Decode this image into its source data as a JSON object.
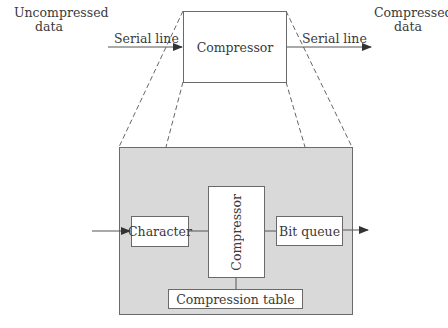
{
  "top": {
    "input_label": "Uncompressed data",
    "input_line1": "Uncompressed",
    "input_line2": "data",
    "input_link_label": "Serial line",
    "compressor_label": "Compressor",
    "output_link_label": "Serial line",
    "output_line1": "Compressed",
    "output_line2": "data"
  },
  "detail": {
    "character_label": "Character",
    "compressor_label": "Compressor",
    "bit_queue_label": "Bit queue",
    "compression_table_label": "Compression table"
  },
  "colors": {
    "detail_background": "#d9d9d9",
    "box_border": "#6a6a6a",
    "line": "#555555"
  }
}
